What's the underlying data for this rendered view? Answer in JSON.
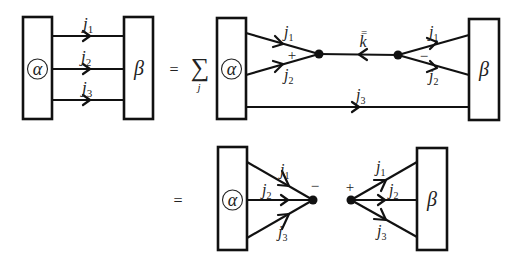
{
  "diagram": {
    "colors": {
      "stroke": "#111111",
      "background": "#ffffff",
      "text": "#222222"
    },
    "symbols": {
      "alpha": "α",
      "beta": "β",
      "equals": "=",
      "sum": "∑",
      "sum_index": "j",
      "plus": "+",
      "minus": "−"
    },
    "labels": {
      "j": "j",
      "k": "k",
      "sub1": "1",
      "sub2": "2",
      "sub3": "3",
      "kbar_mark": "="
    },
    "panels": [
      {
        "id": "lhs",
        "desc": "alpha box connected to beta box by lines j1, j2, j3 (arrows right)"
      },
      {
        "id": "rhs1",
        "desc": "sum over j: j1, j2 from alpha merge at vertex (+), line k-bar (arrow left) to vertex (−) splitting to j1, j2 into beta; j3 straight alpha→beta"
      },
      {
        "id": "rhs2",
        "desc": "j1, j2, j3 from alpha merge at vertex (−); separate vertex (+) splitting to j1, j2, j3 into beta"
      }
    ]
  }
}
